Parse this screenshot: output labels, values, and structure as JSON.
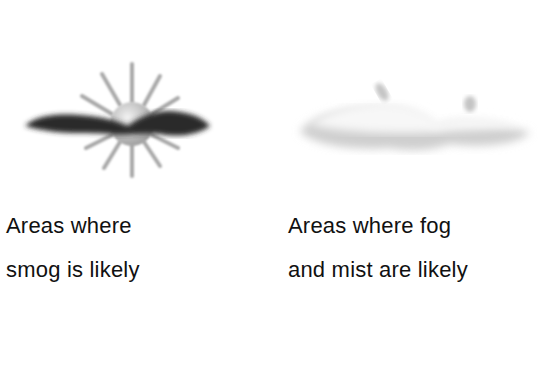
{
  "legend": {
    "items": [
      {
        "icon": "smog-icon",
        "label_lines": [
          "Areas where",
          "smog is likely"
        ],
        "colors": {
          "cloud": "#2a2a2a",
          "sun": "#c8c8c8"
        }
      },
      {
        "icon": "fog-mist-icon",
        "label_lines": [
          "Areas where fog",
          "and mist are likely"
        ],
        "colors": {
          "cloud": "#d8d8d8"
        }
      }
    ]
  }
}
